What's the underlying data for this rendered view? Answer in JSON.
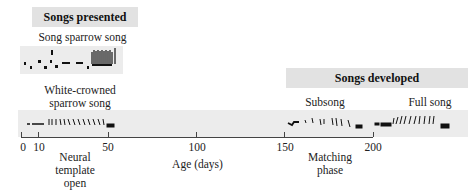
{
  "headers": {
    "presented": "Songs presented",
    "developed": "Songs developed"
  },
  "songs": {
    "song_sparrow": "Song sparrow song",
    "white_crowned_l1": "White-crowned",
    "white_crowned_l2": "sparrow song",
    "subsong": "Subsong",
    "full_song": "Full song"
  },
  "axis": {
    "label": "Age (days)",
    "ticks": [
      "0",
      "10",
      "50",
      "100",
      "150",
      "200"
    ]
  },
  "phases": {
    "neural_l1": "Neural",
    "neural_l2": "template",
    "neural_l3": "open",
    "matching_l1": "Matching",
    "matching_l2": "phase"
  }
}
